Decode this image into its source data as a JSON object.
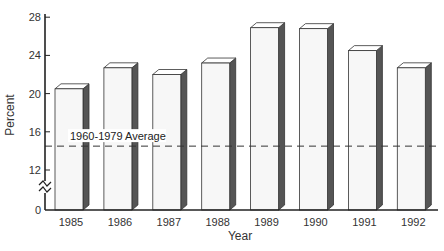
{
  "chart_data": {
    "type": "bar",
    "style": "3d-column",
    "title": "",
    "xlabel": "Year",
    "ylabel": "Percent",
    "categories": [
      "1985",
      "1986",
      "1987",
      "1988",
      "1989",
      "1990",
      "1991",
      "1992"
    ],
    "values": [
      20.5,
      22.7,
      22.0,
      23.2,
      26.9,
      26.8,
      24.5,
      22.7
    ],
    "yticks": [
      0,
      12,
      16,
      20,
      24,
      28
    ],
    "ylim": [
      0,
      28
    ],
    "axis_break": true,
    "grid": false,
    "legend": null,
    "reference_line": {
      "label": "1960-1979 Average",
      "value": 14.5,
      "style": "dashed"
    },
    "colors": {
      "bar_front": "#f7f7f7",
      "bar_top": "#ffffff",
      "bar_side": "#555555",
      "outline": "#333333",
      "axis": "#222222"
    }
  }
}
